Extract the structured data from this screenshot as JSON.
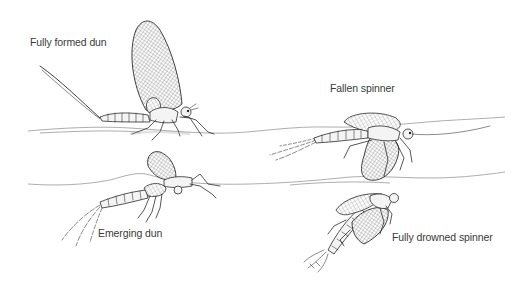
{
  "figure": {
    "background": "#ffffff",
    "ink_color": "#2b2b2b",
    "label_color": "#3a3a3a",
    "labels": {
      "fully_formed_dun": "Fully formed dun",
      "fallen_spinner": "Fallen spinner",
      "emerging_dun": "Emerging dun",
      "fully_drowned_spinner": "Fully drowned spinner"
    },
    "stages": [
      {
        "name": "Fully formed dun",
        "position": "upper-left",
        "relation_to_surface": "standing on upper water surface, wings upright"
      },
      {
        "name": "Fallen spinner",
        "position": "upper-right",
        "relation_to_surface": "lying flat in upper water surface, wings spread"
      },
      {
        "name": "Emerging dun",
        "position": "lower-left",
        "relation_to_surface": "breaking through lower water surface"
      },
      {
        "name": "Fully drowned spinner",
        "position": "lower-right",
        "relation_to_surface": "sunk below lower water surface"
      }
    ]
  }
}
